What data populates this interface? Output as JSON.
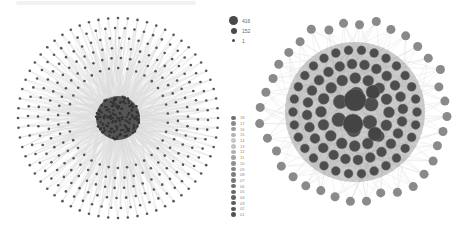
{
  "figure": {
    "caption": "",
    "left_network": {
      "cx": 118,
      "cy": 118,
      "core_radius": 22,
      "rings": [
        {
          "r": 100,
          "n": 64
        },
        {
          "r": 90,
          "n": 58
        },
        {
          "r": 80,
          "n": 52
        },
        {
          "r": 70,
          "n": 46
        },
        {
          "r": 60,
          "n": 40
        },
        {
          "r": 50,
          "n": 34
        }
      ],
      "node_color": "#555555",
      "edge_color": "#9a9a9a",
      "core_color": "#3d3d3d"
    },
    "right_network": {
      "cx": 355,
      "cy": 112,
      "outer_ring": {
        "r": 92,
        "n": 36,
        "node_r": 4.5,
        "color": "#8a8a8a"
      },
      "inner_rings": [
        {
          "r": 62,
          "n": 30,
          "node_r": 4.5
        },
        {
          "r": 48,
          "n": 24,
          "node_r": 5
        },
        {
          "r": 34,
          "n": 16,
          "node_r": 5.5
        },
        {
          "r": 18,
          "n": 6,
          "node_r": 7
        }
      ],
      "hubs": [
        {
          "dx": 0,
          "dy": -12,
          "r": 11
        },
        {
          "dx": -2,
          "dy": 12,
          "r": 10
        },
        {
          "dx": 18,
          "dy": -20,
          "r": 7
        },
        {
          "dx": 20,
          "dy": 22,
          "r": 7
        }
      ],
      "node_color": "#4d4d4d",
      "edge_color": "#bdbdbd"
    }
  },
  "legend_size": {
    "items": [
      {
        "label": "416",
        "size": 9
      },
      {
        "label": "152",
        "size": 6
      },
      {
        "label": "1",
        "size": 3
      }
    ]
  },
  "legend_color": {
    "items": [
      {
        "label": "18",
        "color": "#6f6f6f"
      },
      {
        "label": "17",
        "color": "#8a8a8a"
      },
      {
        "label": "16",
        "color": "#9c9c9c"
      },
      {
        "label": "15",
        "color": "#b3b3b3"
      },
      {
        "label": "14",
        "color": "#c6c6c6"
      },
      {
        "label": "13",
        "color": "#c2c2c2"
      },
      {
        "label": "12",
        "color": "#b0b0b0"
      },
      {
        "label": "11",
        "color": "#a3a3a3"
      },
      {
        "label": "10",
        "color": "#8f8f8f"
      },
      {
        "label": "09",
        "color": "#858585"
      },
      {
        "label": "08",
        "color": "#7d7d7d"
      },
      {
        "label": "07",
        "color": "#777777"
      },
      {
        "label": "06",
        "color": "#6f6f6f"
      },
      {
        "label": "05",
        "color": "#696969"
      },
      {
        "label": "04",
        "color": "#636363"
      },
      {
        "label": "03",
        "color": "#5d5d5d"
      },
      {
        "label": "02",
        "color": "#575757"
      },
      {
        "label": "01",
        "color": "#515151"
      }
    ]
  }
}
